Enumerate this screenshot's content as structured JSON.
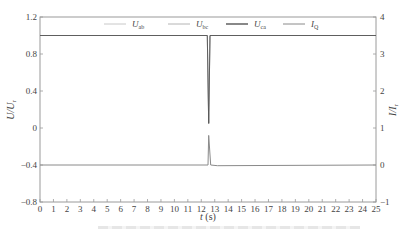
{
  "chart_data": {
    "type": "line",
    "title": "",
    "xlabel": "t (s)",
    "ylabel_left": "U/U_r",
    "ylabel_right": "I/I_r",
    "xlim": [
      0,
      25
    ],
    "ylim_left": [
      -0.8,
      1.2
    ],
    "ylim_right": [
      -1,
      4
    ],
    "x_ticks": [
      0,
      1,
      2,
      3,
      4,
      5,
      6,
      7,
      8,
      9,
      10,
      11,
      12,
      13,
      14,
      15,
      16,
      17,
      18,
      19,
      20,
      21,
      22,
      23,
      24,
      25
    ],
    "y_ticks_left": [
      "1.2",
      "0.8",
      "0.4",
      "0",
      "-0.4",
      "-0.8"
    ],
    "y_ticks_right": [
      "4",
      "3",
      "2",
      "1",
      "0",
      "-1"
    ],
    "grid": false,
    "legend_position": "top, inside",
    "legend": [
      {
        "name": "U_ab",
        "main": "U",
        "sub": "ab",
        "color": "#c8c8c8"
      },
      {
        "name": "U_bc",
        "main": "U",
        "sub": "bc",
        "color": "#b4b4b4"
      },
      {
        "name": "U_ca",
        "main": "U",
        "sub": "ca",
        "color": "#555555"
      },
      {
        "name": "I_Q",
        "main": "I",
        "sub": "Q",
        "color": "#8a8a8a"
      }
    ],
    "series": [
      {
        "name": "U_ab",
        "axis": "left",
        "points": [
          [
            0,
            1.0
          ],
          [
            12.45,
            1.0
          ],
          [
            12.55,
            0.05
          ],
          [
            12.65,
            1.0
          ],
          [
            25,
            1.0
          ]
        ]
      },
      {
        "name": "U_bc",
        "axis": "left",
        "points": [
          [
            0,
            1.0
          ],
          [
            12.45,
            1.0
          ],
          [
            12.55,
            0.05
          ],
          [
            12.65,
            1.0
          ],
          [
            25,
            1.0
          ]
        ]
      },
      {
        "name": "U_ca",
        "axis": "left",
        "points": [
          [
            0,
            1.0
          ],
          [
            12.45,
            1.0
          ],
          [
            12.55,
            0.05
          ],
          [
            12.65,
            1.0
          ],
          [
            25,
            1.0
          ]
        ]
      },
      {
        "name": "I_Q",
        "axis": "right",
        "points": [
          [
            0,
            0.0
          ],
          [
            12.5,
            0.0
          ],
          [
            12.55,
            0.8
          ],
          [
            12.7,
            0.0
          ],
          [
            13.2,
            -0.02
          ],
          [
            25,
            0.0
          ]
        ]
      }
    ]
  },
  "caption": ""
}
